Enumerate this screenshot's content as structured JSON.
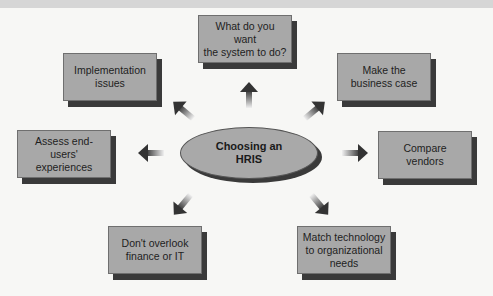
{
  "center": {
    "label_line1": "Choosing an",
    "label_line2": "HRIS"
  },
  "nodes": [
    {
      "id": "top",
      "line1": "What do you want",
      "line2": "the system to do?"
    },
    {
      "id": "top-left",
      "line1": "Implementation",
      "line2": "issues"
    },
    {
      "id": "top-right",
      "line1": "Make the",
      "line2": "business case"
    },
    {
      "id": "left",
      "line1": "Assess end-users'",
      "line2": "experiences"
    },
    {
      "id": "right",
      "line1": "Compare",
      "line2": "vendors"
    },
    {
      "id": "bottom-left",
      "line1": "Don't overlook",
      "line2": "finance or IT"
    },
    {
      "id": "bottom-right",
      "line1": "Match technology",
      "line2": "to organizational",
      "line3": "needs"
    }
  ],
  "colors": {
    "box_fill": "#a8a8a8",
    "shadow": "#3a3a3a",
    "arrow": "#3a3a3a"
  }
}
